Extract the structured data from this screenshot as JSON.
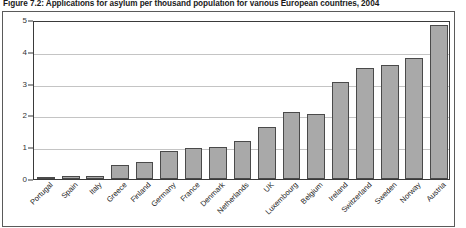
{
  "figure": {
    "title": "Figure 7.2: Applications for asylum per thousand population for various European countries, 2004"
  },
  "chart_data": {
    "type": "bar",
    "title": "Figure 7.2: Applications for asylum per thousand population for various European countries, 2004",
    "xlabel": "",
    "ylabel": "",
    "ylim": [
      0,
      5
    ],
    "yticks": [
      "0",
      "1",
      "2",
      "3",
      "4",
      "5"
    ],
    "grid": true,
    "legend": "none",
    "bar_color": "#a9a9a9",
    "bar_border_color": "#4a4a4a",
    "categories": [
      "Portugal",
      "Spain",
      "Italy",
      "Greece",
      "Finland",
      "Germany",
      "France",
      "Denmark",
      "Netherlands",
      "UK",
      "Luxembourg",
      "Belgium",
      "Ireland",
      "Switzerland",
      "Sweden",
      "Norway",
      "Austria"
    ],
    "values": [
      0.03,
      0.1,
      0.1,
      0.45,
      0.55,
      0.88,
      0.98,
      1.0,
      1.2,
      1.65,
      2.1,
      2.05,
      3.05,
      3.5,
      3.6,
      3.8,
      4.85
    ]
  }
}
